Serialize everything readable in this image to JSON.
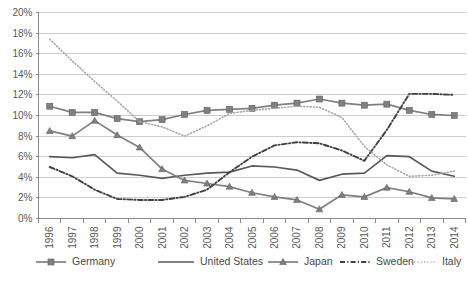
{
  "chart_data": {
    "type": "line",
    "title": "",
    "subtitle": "",
    "xlabel": "",
    "ylabel": "",
    "grid": true,
    "legend_position": "bottom",
    "ylim": [
      0,
      20
    ],
    "ytick_step": 2,
    "ytick_labels": [
      "0%",
      "2%",
      "4%",
      "6%",
      "8%",
      "10%",
      "12%",
      "14%",
      "16%",
      "18%",
      "20%"
    ],
    "ytick_values": [
      0,
      2,
      4,
      6,
      8,
      10,
      12,
      14,
      16,
      18,
      20
    ],
    "categories": [
      "1996",
      "1997",
      "1998",
      "1999",
      "2000",
      "2001",
      "2002",
      "2003",
      "2004",
      "2005",
      "2006",
      "2007",
      "2008",
      "2009",
      "2010",
      "2011",
      "2012",
      "2013",
      "2014"
    ],
    "x": [
      1996,
      1997,
      1998,
      1999,
      2000,
      2001,
      2002,
      2003,
      2004,
      2005,
      2006,
      2007,
      2008,
      2009,
      2010,
      2011,
      2012,
      2013,
      2014
    ],
    "series": [
      {
        "name": "Germany",
        "marker": "square",
        "style": "solid",
        "color": "#808080",
        "values": [
          10.9,
          10.3,
          10.3,
          9.7,
          9.4,
          9.6,
          10.1,
          10.5,
          10.6,
          10.7,
          11.0,
          11.2,
          11.6,
          11.2,
          11.0,
          11.1,
          10.5,
          10.1,
          10.0
        ]
      },
      {
        "name": "United States",
        "marker": "none",
        "style": "solid",
        "color": "#595959",
        "values": [
          6.0,
          5.9,
          6.2,
          4.4,
          4.2,
          3.9,
          4.2,
          4.4,
          4.5,
          5.1,
          5.0,
          4.7,
          3.7,
          4.3,
          4.4,
          6.1,
          6.0,
          4.6,
          4.1
        ]
      },
      {
        "name": "Japan",
        "marker": "triangle",
        "style": "solid",
        "color": "#808080",
        "values": [
          8.5,
          8.0,
          9.5,
          8.1,
          6.9,
          4.8,
          3.7,
          3.4,
          3.1,
          2.5,
          2.1,
          1.8,
          0.9,
          2.3,
          2.1,
          3.0,
          2.6,
          2.0,
          1.9
        ]
      },
      {
        "name": "Sweden",
        "marker": "none",
        "style": "dashdot",
        "color": "#404040",
        "values": [
          5.0,
          4.1,
          2.8,
          1.9,
          1.8,
          1.8,
          2.1,
          2.8,
          4.5,
          6.0,
          7.1,
          7.4,
          7.3,
          6.6,
          5.6,
          8.6,
          12.1,
          12.1,
          12.0
        ]
      },
      {
        "name": "Italy",
        "marker": "none",
        "style": "dotted",
        "color": "#a6a6a6",
        "values": [
          17.4,
          15.3,
          13.3,
          11.4,
          9.4,
          8.9,
          8.0,
          9.0,
          10.2,
          10.5,
          10.7,
          10.9,
          10.8,
          9.8,
          7.0,
          5.2,
          4.1,
          4.2,
          4.6
        ]
      }
    ]
  },
  "legend": {
    "items": [
      {
        "label": "Germany"
      },
      {
        "label": "United States"
      },
      {
        "label": "Japan"
      },
      {
        "label": "Sweden"
      },
      {
        "label": "Italy"
      }
    ]
  }
}
